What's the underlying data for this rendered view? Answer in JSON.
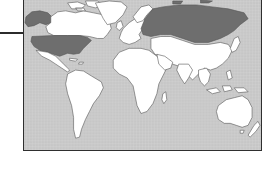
{
  "map": {
    "type": "world-map",
    "style": "grayscale-scan",
    "colors": {
      "ocean": "#c9c9c9",
      "land": "#ffffff",
      "highlight": "#6e6e6e",
      "border": "#2f2f2f",
      "coast": "#555555"
    },
    "highlighted_regions": [
      "United States",
      "Alaska",
      "Russia"
    ],
    "unhighlighted_regions": [
      "Canada",
      "Greenland",
      "Mexico",
      "Central America",
      "South America",
      "Europe",
      "Africa",
      "Middle East",
      "Central Asia",
      "China",
      "India",
      "Southeast Asia",
      "Japan",
      "Indonesia",
      "Australia",
      "New Zealand"
    ]
  },
  "annotations": {
    "leader_line": "horizontal rule entering from left edge"
  }
}
